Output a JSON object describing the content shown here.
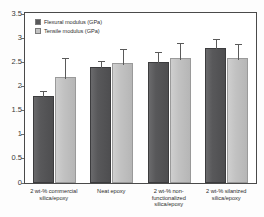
{
  "chart_data": {
    "type": "bar",
    "title": "",
    "xlabel": "",
    "ylabel": "",
    "ylim": [
      0,
      3.5
    ],
    "yticks": [
      "0",
      "0.5",
      "1",
      "1.5",
      "2",
      "2.5",
      "3",
      "3.5"
    ],
    "grid": false,
    "legend_position": "top-left",
    "categories": [
      "2 wt-% commercial silica/epoxy",
      "Neat epoxy",
      "2 wt-% non-functionalized silica/epoxy",
      "2 wt-% silanized silica/epoxy"
    ],
    "category_lines": [
      [
        "2 wt-% commercial",
        "silica/epoxy"
      ],
      [
        "Neat epoxy"
      ],
      [
        "2 wt-% non-",
        "functionalized",
        "silica/epoxy"
      ],
      [
        "2 wt-% silanized",
        "silica/epoxy"
      ]
    ],
    "series": [
      {
        "name": "Flexural modulus (GPa)",
        "color": "#58585a",
        "values": [
          1.8,
          2.4,
          2.5,
          2.78
        ],
        "errors": [
          0.08,
          0.1,
          0.18,
          0.17
        ]
      },
      {
        "name": "Tensile modulus (GPa)",
        "color": "#c2c2c2",
        "values": [
          2.18,
          2.47,
          2.57,
          2.57
        ],
        "errors": [
          0.37,
          0.28,
          0.3,
          0.27
        ]
      }
    ]
  },
  "legend": {
    "items": [
      {
        "label": "Flexural modulus (GPa)",
        "color": "#58585a"
      },
      {
        "label": "Tensile modulus (GPa)",
        "color": "#c2c2c2"
      }
    ]
  }
}
